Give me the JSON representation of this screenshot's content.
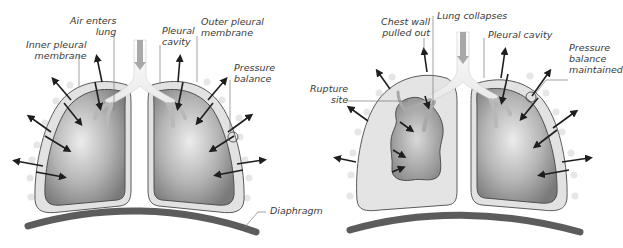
{
  "left_panel": {
    "title": "Normal lung",
    "labels": {
      "air_enters_1": "Air enters",
      "air_enters_2": "lung",
      "inner_pleural_1": "Inner pleural",
      "inner_pleural_2": "membrane",
      "pleural_cavity_1": "Pleural",
      "pleural_cavity_2": "cavity",
      "outer_pleural_1": "Outer pleural",
      "outer_pleural_2": "membrane",
      "pressure_balance_1": "Pressure",
      "pressure_balance_2": "balance",
      "diaphragm": "Diaphragm"
    }
  },
  "right_panel": {
    "title": "Collapsed lung",
    "labels": {
      "chest_wall_1": "Chest wall",
      "chest_wall_2": "pulled out",
      "lung_collapses": "Lung collapses",
      "pleural_cavity": "Pleural cavity",
      "pressure_maintained_1": "Pressure",
      "pressure_maintained_2": "balance",
      "pressure_maintained_3": "maintained",
      "rupture_1": "Rupture",
      "rupture_2": "site"
    }
  },
  "colors": {
    "lung_dark": "#7f7f7f",
    "lung_light": "#e6e6e6",
    "pleura": "#dcdcdc",
    "outline": "#5a5a5a",
    "diaphragm": "#5c5c5c",
    "arrow": "#1e1e1e",
    "leader_line": "#7a7a7a",
    "label_text": "#3a3a3a",
    "bronchi": "#bfbfbf"
  }
}
